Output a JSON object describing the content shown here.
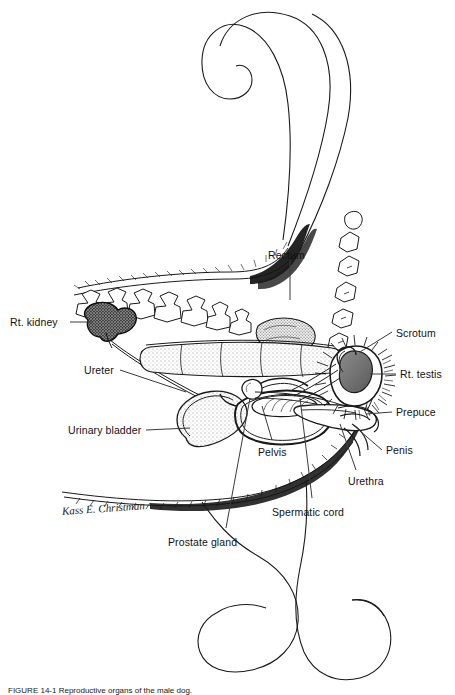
{
  "figure": {
    "caption_text": "FIGURE 14-1 Reproductive organs of the male dog.",
    "artist_signature": "Kass E. Christman",
    "background_color": "#ffffff",
    "ink_color": "#000000",
    "testis_fill": "#6e6e6e",
    "kidney_fill": "#4a4a4a"
  },
  "labels": [
    {
      "id": "rt-kidney",
      "text": "Rt. kidney",
      "x": 10,
      "y": 316,
      "align": "left"
    },
    {
      "id": "ureter",
      "text": "Ureter",
      "x": 84,
      "y": 364,
      "align": "left"
    },
    {
      "id": "urinary-bladder",
      "text": "Urinary bladder",
      "x": 68,
      "y": 424,
      "align": "left"
    },
    {
      "id": "prostate-gland",
      "text": "Prostate gland",
      "x": 168,
      "y": 536,
      "align": "left"
    },
    {
      "id": "rectum",
      "text": "Rectum",
      "x": 268,
      "y": 249,
      "align": "left"
    },
    {
      "id": "pelvis",
      "text": "Pelvis",
      "x": 258,
      "y": 446,
      "align": "left"
    },
    {
      "id": "spermatic-cord",
      "text": "Spermatic cord",
      "x": 272,
      "y": 506,
      "align": "left"
    },
    {
      "id": "scrotum",
      "text": "Scrotum",
      "x": 396,
      "y": 327,
      "align": "left"
    },
    {
      "id": "rt-testis",
      "text": "Rt. testis",
      "x": 400,
      "y": 370,
      "align": "left"
    },
    {
      "id": "prepuce",
      "text": "Prepuce",
      "x": 396,
      "y": 408,
      "align": "left"
    },
    {
      "id": "penis",
      "text": "Penis",
      "x": 386,
      "y": 446,
      "align": "left"
    },
    {
      "id": "urethra",
      "text": "Urethra",
      "x": 348,
      "y": 477,
      "align": "left"
    }
  ],
  "structures": [
    {
      "id": "tail",
      "name": "tail"
    },
    {
      "id": "lumbar-vertebrae",
      "name": "lumbar vertebrae"
    },
    {
      "id": "sacrum",
      "name": "sacrum"
    },
    {
      "id": "caudal-vertebrae",
      "name": "caudal vertebrae"
    },
    {
      "id": "kidney",
      "name": "right kidney"
    },
    {
      "id": "ureter",
      "name": "ureter"
    },
    {
      "id": "rectum",
      "name": "rectum"
    },
    {
      "id": "urinary-bladder",
      "name": "urinary bladder"
    },
    {
      "id": "pelvis",
      "name": "pelvis"
    },
    {
      "id": "prostate",
      "name": "prostate gland"
    },
    {
      "id": "urethra",
      "name": "urethra"
    },
    {
      "id": "penis",
      "name": "penis"
    },
    {
      "id": "prepuce",
      "name": "prepuce"
    },
    {
      "id": "scrotum",
      "name": "scrotum"
    },
    {
      "id": "testis",
      "name": "right testis"
    },
    {
      "id": "spermatic-cord",
      "name": "spermatic cord"
    },
    {
      "id": "hind-limb",
      "name": "hind limb outline"
    },
    {
      "id": "body-outline",
      "name": "body wall outline"
    }
  ]
}
